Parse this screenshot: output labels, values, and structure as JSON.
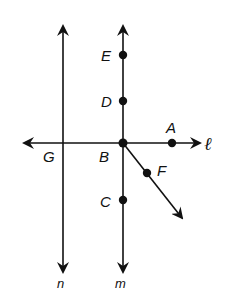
{
  "diagram": {
    "type": "geometry-lines-and-points",
    "lines": [
      {
        "name": "n",
        "label": "n",
        "orientation": "vertical"
      },
      {
        "name": "m",
        "label": "m",
        "orientation": "vertical"
      },
      {
        "name": "l",
        "label": "ℓ",
        "orientation": "horizontal"
      }
    ],
    "rays": [
      {
        "name": "BF",
        "from": "B",
        "through": "F"
      }
    ],
    "points": [
      {
        "name": "E",
        "label": "E",
        "on": "m"
      },
      {
        "name": "D",
        "label": "D",
        "on": "m"
      },
      {
        "name": "B",
        "label": "B",
        "on": "m,ℓ"
      },
      {
        "name": "C",
        "label": "C",
        "on": "m"
      },
      {
        "name": "A",
        "label": "A",
        "on": "ℓ"
      },
      {
        "name": "G",
        "label": "G",
        "on": "ℓ,n"
      },
      {
        "name": "F",
        "label": "F",
        "on": "ray BF"
      }
    ],
    "color": "#111111"
  },
  "labels": {
    "E": "E",
    "D": "D",
    "A": "A",
    "G": "G",
    "B": "B",
    "F": "F",
    "C": "C",
    "ell": "ℓ",
    "n": "n",
    "m": "m"
  }
}
